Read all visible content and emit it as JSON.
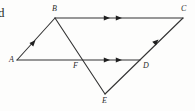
{
  "figure": {
    "background_color": "#fdfdfc",
    "stroke_color": "#333333",
    "label_color": "#2b2b2b",
    "width": 195,
    "height": 111,
    "clipped_glyph": "d",
    "vertices": [
      {
        "id": "A",
        "label": "A",
        "x": 17,
        "y": 60
      },
      {
        "id": "B",
        "label": "B",
        "x": 55,
        "y": 18
      },
      {
        "id": "C",
        "label": "C",
        "x": 183,
        "y": 18
      },
      {
        "id": "D",
        "label": "D",
        "x": 140,
        "y": 60
      },
      {
        "id": "E",
        "label": "E",
        "x": 105,
        "y": 94
      },
      {
        "id": "F",
        "label": "F",
        "x": 76,
        "y": 60
      }
    ],
    "vertex_labels": [
      {
        "text": "A",
        "left": 9,
        "top": 56
      },
      {
        "text": "B",
        "left": 52,
        "top": 5
      },
      {
        "text": "C",
        "left": 181,
        "top": 5
      },
      {
        "text": "D",
        "left": 143,
        "top": 62
      },
      {
        "text": "E",
        "left": 102,
        "top": 97
      },
      {
        "text": "F",
        "left": 73,
        "top": 62
      }
    ],
    "segments": [
      {
        "name": "segment-AB",
        "from": "A",
        "to": "B",
        "arrows": 1
      },
      {
        "name": "segment-BC",
        "from": "B",
        "to": "C",
        "arrows": 2
      },
      {
        "name": "segment-AD",
        "from": "A",
        "to": "D",
        "arrows": 2
      },
      {
        "name": "segment-BE",
        "from": "B",
        "to": "E",
        "arrows": 0
      },
      {
        "name": "segment-EC",
        "from": "E",
        "to": "C",
        "arrows": 1
      }
    ]
  }
}
